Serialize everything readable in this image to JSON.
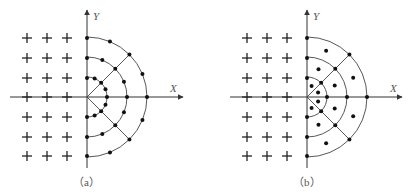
{
  "figure": {
    "panels": [
      {
        "id": "a",
        "caption": "（a）",
        "x_axis_label": "X",
        "y_axis_label": "Y",
        "origin": [
          87,
          97
        ],
        "radii": [
          20,
          40,
          60
        ],
        "grid": {
          "columns": [
            27,
            47,
            67,
            87
          ],
          "rows": [
            38,
            58,
            78,
            97,
            117,
            137,
            156
          ]
        },
        "description": "Cartesian grid (+) on left half; polar mesh with nodes on arcs on right half"
      },
      {
        "id": "b",
        "caption": "（b）",
        "x_axis_label": "X",
        "y_axis_label": "Y",
        "origin": [
          307,
          97
        ],
        "radii": [
          20,
          40,
          60
        ],
        "grid": {
          "columns": [
            247,
            267,
            287,
            307
          ],
          "rows": [
            38,
            58,
            78,
            97,
            117,
            137,
            156
          ]
        },
        "description": "Cartesian grid (+) on left half; polar mesh with cell-centered nodes on right half"
      }
    ],
    "colors": {
      "line": "#444444",
      "point": "#111111",
      "text": "#555555"
    }
  }
}
